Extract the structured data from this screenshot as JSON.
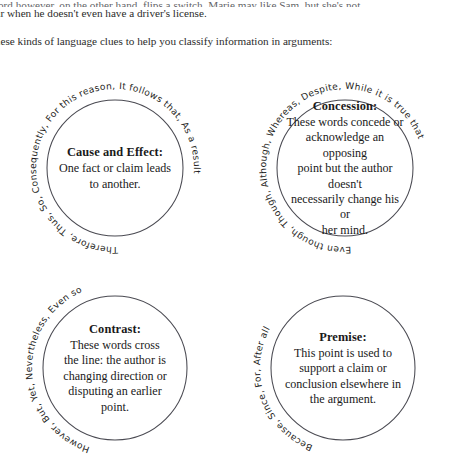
{
  "page": {
    "background_color": "#ffffff",
    "text_color": "#1a1a1a",
    "ring_color": "#4a4a52"
  },
  "prose": {
    "line_clipped": "t word however, on the other hand, flips a switch. Marie may like Sam, but she's not",
    "line_2": "r car when he doesn't even have a driver's license.",
    "line_3": "e these kinds of language clues to help you classify information in arguments:"
  },
  "diagram": {
    "nodes": [
      {
        "id": "cause-and-effect",
        "title": "Cause and Effect:",
        "description": "One fact or claim leads to another.",
        "desc_lines": [
          "One fact or claim leads",
          "to another."
        ],
        "keywords": "Therefore, Thus, So, Consequently, For this reason, It follows that, As a result",
        "cx": 115,
        "cy": 106,
        "r": 68,
        "arc_r": 79,
        "arc_start_deg": 175,
        "arc_sweep_deg": 290
      },
      {
        "id": "concession",
        "title": "Concession:",
        "description": "These words concede or acknowledge an opposing point but the author doesn't necessarily change his or her mind.",
        "desc_lines": [
          "These words concede or",
          "acknowledge an opposing",
          "point but the author doesn't",
          "necessarily change his or",
          "her mind."
        ],
        "keywords": "Even though, Though, Although, Whereas, Despite, While it is true that",
        "cx": 345,
        "cy": 106,
        "r": 68,
        "arc_r": 79,
        "arc_start_deg": 173,
        "arc_sweep_deg": 268
      },
      {
        "id": "contrast",
        "title": "Contrast:",
        "description": "These words cross the line: the author is changing direction or disputing an earlier point.",
        "desc_lines": [
          "These words cross",
          "the line: the author is",
          "changing direction or",
          "disputing an earlier",
          "point."
        ],
        "keywords": "However, But, Yet, Nevertheless, Even so",
        "cx": 115,
        "cy": 306,
        "r": 72,
        "arc_r": 83,
        "arc_start_deg": 196,
        "arc_sweep_deg": 148
      },
      {
        "id": "premise",
        "title": "Premise:",
        "description": "This point is used to support a claim or conclusion elsewhere in the argument.",
        "desc_lines": [
          "This point is used to",
          "support a claim or",
          "conclusion elsewhere in",
          "the argument."
        ],
        "keywords": "Because, Since, For, After all",
        "cx": 343,
        "cy": 306,
        "r": 72,
        "arc_r": 83,
        "arc_start_deg": 200,
        "arc_sweep_deg": 128
      }
    ]
  }
}
